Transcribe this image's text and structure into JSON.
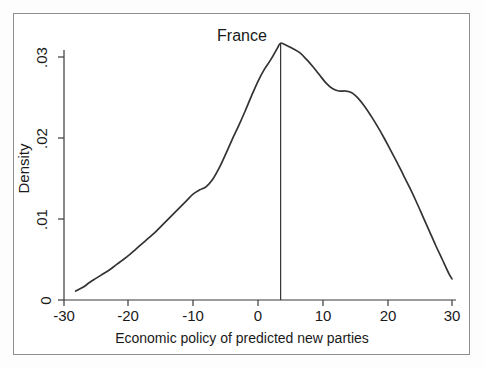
{
  "chart_data": {
    "type": "line",
    "title": "France",
    "subtitle": "",
    "xlabel": "Economic policy of predicted new parties",
    "ylabel": "Density",
    "xlim": [
      -30,
      30
    ],
    "ylim": [
      0,
      0.033
    ],
    "xticks": [
      -30,
      -20,
      -10,
      0,
      10,
      20,
      30
    ],
    "xtick_labels": [
      "-30",
      "-20",
      "-10",
      "0",
      "10",
      "20",
      "30"
    ],
    "yticks": [
      0,
      0.01,
      0.02,
      0.03
    ],
    "ytick_labels": [
      "0",
      ".01",
      ".02",
      ".03"
    ],
    "grid": false,
    "legend": false,
    "legend_position": "none",
    "line_color": "#333333",
    "series": [
      {
        "name": "Kernel density of economic policy",
        "x": [
          -28.2,
          -27.0,
          -26.0,
          -25.0,
          -24.0,
          -23.0,
          -22.0,
          -21.0,
          -20.0,
          -19.0,
          -18.0,
          -17.0,
          -16.0,
          -15.0,
          -14.0,
          -13.0,
          -12.0,
          -11.0,
          -10.0,
          -9.0,
          -8.0,
          -7.0,
          -6.0,
          -5.0,
          -4.0,
          -3.0,
          -2.0,
          -1.0,
          0.0,
          1.0,
          2.0,
          3.0,
          3.5,
          4.5,
          5.5,
          6.5,
          7.5,
          8.5,
          9.5,
          10.5,
          11.5,
          12.5,
          13.5,
          14.5,
          15.5,
          16.5,
          17.5,
          18.5,
          19.5,
          20.5,
          21.5,
          22.5,
          23.5,
          24.5,
          25.5,
          26.5,
          27.5,
          28.5,
          29.5,
          30.0
        ],
        "y": [
          0.0011,
          0.0016,
          0.0022,
          0.0027,
          0.0032,
          0.0037,
          0.0043,
          0.0049,
          0.0055,
          0.0062,
          0.0069,
          0.0076,
          0.0083,
          0.0091,
          0.0099,
          0.0107,
          0.0115,
          0.0123,
          0.0131,
          0.0136,
          0.014,
          0.0149,
          0.0163,
          0.018,
          0.0198,
          0.0215,
          0.0233,
          0.0252,
          0.027,
          0.0285,
          0.0297,
          0.0311,
          0.0317,
          0.0314,
          0.031,
          0.0305,
          0.0297,
          0.0288,
          0.0278,
          0.0268,
          0.0261,
          0.0258,
          0.0258,
          0.0256,
          0.0249,
          0.0239,
          0.0227,
          0.0214,
          0.02,
          0.0185,
          0.017,
          0.0154,
          0.0138,
          0.0121,
          0.0103,
          0.0085,
          0.0067,
          0.005,
          0.0033,
          0.0026
        ]
      }
    ],
    "annotations": [
      {
        "name": "mean-marker-line",
        "type": "vline",
        "x": 3.5,
        "y_from": 0,
        "y_to": 0.0317,
        "label": ""
      }
    ]
  }
}
